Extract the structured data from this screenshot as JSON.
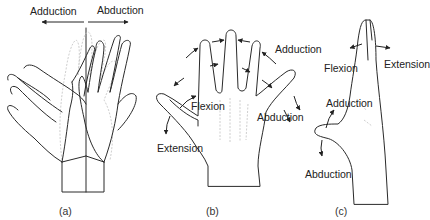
{
  "figure": {
    "panel_a": {
      "caption": "(a)",
      "labels": {
        "left": "Adduction",
        "right": "Abduction"
      }
    },
    "panel_b": {
      "caption": "(b)",
      "labels": {
        "adduction": "Adduction",
        "flexion": "Flexion",
        "extension": "Extension",
        "abduction": "Abduction"
      }
    },
    "panel_c": {
      "caption": "(c)",
      "labels": {
        "flexion": "Flexion",
        "extension": "Extension",
        "adduction": "Adduction",
        "abduction": "Abduction"
      }
    },
    "colors": {
      "line": "#2a2a2a",
      "faint": "#c8c8c8",
      "background": "#ffffff"
    }
  }
}
